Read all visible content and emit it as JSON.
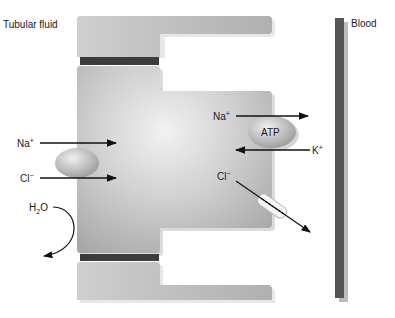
{
  "labels": {
    "tubular_fluid": "Tubular fluid",
    "blood": "Blood",
    "na_left": "Na",
    "na_left_sup": "+",
    "cl_left": "Cl",
    "cl_left_sup": "−",
    "h2o_h": "H",
    "h2o_sub": "2",
    "h2o_o": "O",
    "na_right": "Na",
    "na_right_sup": "+",
    "k_right": "K",
    "k_right_sup": "+",
    "cl_right": "Cl",
    "cl_right_sup": "−",
    "atp": "ATP"
  },
  "colors": {
    "cell_light": "#e6e6e6",
    "cell_mid": "#bdbdbd",
    "cell_dark": "#9e9e9e",
    "junction": "#3c3c3c",
    "vessel": "#555555",
    "arrow": "#111111"
  }
}
